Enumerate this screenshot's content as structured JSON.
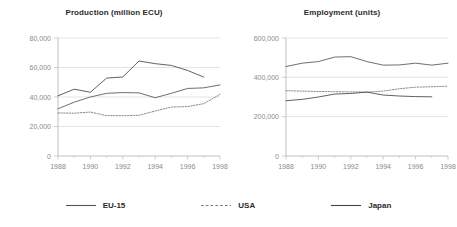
{
  "figure": {
    "background": "#ffffff",
    "axis_color": "#b9b9b9",
    "grid_color": "#d8d8d8",
    "tick_label_color": "#8a8a8a",
    "title_color": "#2b2b2b"
  },
  "legend": {
    "position": "bottom-center",
    "items": [
      {
        "label": "EU-15",
        "style": "solid",
        "color": "#555555",
        "swatch_name": "legend-swatch-eu15"
      },
      {
        "label": "USA",
        "style": "dashed",
        "color": "#777777",
        "swatch_name": "legend-swatch-usa"
      },
      {
        "label": "Japan",
        "style": "solid",
        "color": "#444444",
        "swatch_name": "legend-swatch-japan"
      }
    ]
  },
  "chart_data": [
    {
      "type": "line",
      "title": "Production (million ECU)",
      "xlabel": "",
      "ylabel": "",
      "xlim": [
        1988,
        1998
      ],
      "ylim": [
        0,
        80000
      ],
      "xticks": [
        1988,
        1990,
        1992,
        1994,
        1996,
        1998
      ],
      "xtick_labels": [
        "1988",
        "1990",
        "1992",
        "1994",
        "1996",
        "1998"
      ],
      "yticks": [
        0,
        20000,
        40000,
        60000,
        80000
      ],
      "ytick_labels": [
        "0",
        "20,000",
        "40,000",
        "60,000",
        "80,000"
      ],
      "grid": true,
      "grid_axis": "y",
      "legend_position": "external-bottom",
      "x": [
        1988,
        1989,
        1990,
        1991,
        1992,
        1993,
        1994,
        1995,
        1996,
        1997
      ],
      "series": [
        {
          "name": "EU-15",
          "style": "solid",
          "color": "#555555",
          "values": [
            32000,
            36500,
            40000,
            42500,
            43000,
            42800,
            39500,
            42500,
            45800,
            46200,
            48200
          ]
        },
        {
          "name": "USA",
          "style": "dashed",
          "color": "#777777",
          "values": [
            29200,
            29000,
            29800,
            27400,
            27300,
            27600,
            30500,
            33200,
            33500,
            35500,
            41800
          ]
        },
        {
          "name": "Japan",
          "style": "solid",
          "color": "#444444",
          "values": [
            40800,
            45300,
            43200,
            52800,
            53600,
            64400,
            62600,
            61400,
            58000,
            53500
          ]
        }
      ]
    },
    {
      "type": "line",
      "title": "Employment (units)",
      "xlabel": "",
      "ylabel": "",
      "xlim": [
        1988,
        1998
      ],
      "ylim": [
        0,
        600000
      ],
      "xticks": [
        1988,
        1990,
        1992,
        1994,
        1996,
        1998
      ],
      "xtick_labels": [
        "1988",
        "1990",
        "1992",
        "1994",
        "1996",
        "1998"
      ],
      "yticks": [
        0,
        200000,
        400000,
        600000
      ],
      "ytick_labels": [
        "0",
        "200,000",
        "400,000",
        "600,000"
      ],
      "grid": true,
      "grid_axis": "y",
      "legend_position": "external-bottom",
      "x": [
        1988,
        1989,
        1990,
        1991,
        1992,
        1993,
        1994,
        1995,
        1996,
        1997
      ],
      "series": [
        {
          "name": "EU-15",
          "style": "solid",
          "color": "#555555",
          "values": [
            455000,
            472000,
            480000,
            503000,
            505000,
            480000,
            462000,
            463000,
            472000,
            462000,
            472000
          ]
        },
        {
          "name": "USA",
          "style": "dashed",
          "color": "#777777",
          "values": [
            332000,
            330000,
            328000,
            327000,
            326000,
            325000,
            330000,
            342000,
            350000,
            352000,
            355000
          ]
        },
        {
          "name": "Japan",
          "style": "solid",
          "color": "#444444",
          "values": [
            281000,
            288000,
            300000,
            315000,
            318000,
            325000,
            310000,
            305000,
            302000,
            301000
          ]
        }
      ]
    }
  ]
}
